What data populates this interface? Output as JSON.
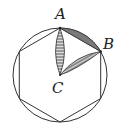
{
  "diagram": {
    "labels": {
      "A": "A",
      "B": "B",
      "C": "C"
    },
    "colors": {
      "stroke": "#333333",
      "shade": "#666666",
      "background": "#ffffff"
    }
  }
}
